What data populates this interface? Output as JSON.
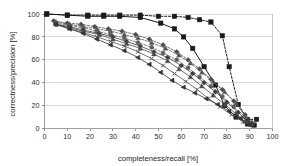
{
  "chart_data": {
    "type": "line",
    "title": "",
    "xlabel": "completeness/recall [%]",
    "ylabel": "correctness/precision [%]",
    "xlim": [
      0,
      100
    ],
    "ylim": [
      0,
      100
    ],
    "xticks": [
      0,
      10,
      20,
      30,
      40,
      50,
      60,
      70,
      80,
      90,
      100
    ],
    "yticks": [
      0,
      20,
      40,
      60,
      80,
      100
    ],
    "xtick_labels": [
      "0",
      "10",
      "20",
      "30",
      "40",
      "50",
      "60",
      "70",
      "80",
      "90",
      "100"
    ],
    "ytick_labels": [
      "0",
      "20",
      "40",
      "60",
      "80",
      "100"
    ],
    "grid": "horizontal",
    "legend": "none",
    "background": "#ffffff",
    "series": [
      {
        "name": "series-1-dashed-square",
        "style": "dashed",
        "marker": "square",
        "color": "#1a1a1a",
        "x": [
          1,
          10,
          19,
          26,
          33,
          42,
          50,
          57,
          63,
          68,
          73,
          78,
          81,
          85,
          89,
          93
        ],
        "y": [
          100,
          99,
          99,
          99,
          99,
          99,
          98,
          98,
          97,
          95,
          93,
          81,
          54,
          21,
          8,
          8
        ]
      },
      {
        "name": "series-2-solid-square",
        "style": "solid",
        "marker": "square",
        "color": "#1a1a1a",
        "x": [
          1,
          10,
          19,
          26,
          33,
          42,
          51,
          57,
          61,
          65,
          70,
          75,
          79,
          84,
          89,
          92
        ],
        "y": [
          100,
          99,
          98,
          98,
          98,
          97,
          92,
          87,
          80,
          70,
          54,
          38,
          20,
          10,
          4,
          3
        ]
      },
      {
        "name": "series-3-dashed-diamond",
        "style": "dashed",
        "marker": "diamond",
        "color": "#4a4a4a",
        "x": [
          4,
          10,
          16,
          22,
          28,
          34,
          40,
          46,
          52,
          58,
          63,
          68,
          73,
          78,
          83,
          88,
          91
        ],
        "y": [
          94,
          92,
          91,
          89,
          87,
          85,
          82,
          78,
          73,
          67,
          60,
          52,
          43,
          34,
          24,
          12,
          5
        ]
      },
      {
        "name": "series-4-dashed-triangle",
        "style": "dashed",
        "marker": "triangle",
        "color": "#555555",
        "x": [
          5,
          11,
          17,
          23,
          29,
          35,
          41,
          47,
          53,
          59,
          64,
          69,
          74,
          79,
          84,
          88,
          91
        ],
        "y": [
          93,
          91,
          89,
          87,
          85,
          82,
          79,
          75,
          70,
          64,
          57,
          49,
          41,
          32,
          22,
          11,
          5
        ]
      },
      {
        "name": "series-5-dashed-circle",
        "style": "dashed",
        "marker": "circle",
        "color": "#5e5e5e",
        "x": [
          5,
          11,
          17,
          23,
          29,
          35,
          41,
          47,
          52,
          58,
          63,
          68,
          73,
          78,
          83,
          88,
          91
        ],
        "y": [
          92,
          90,
          88,
          85,
          82,
          79,
          75,
          71,
          66,
          60,
          53,
          45,
          37,
          28,
          19,
          10,
          4
        ]
      },
      {
        "name": "series-6-solid-diamond",
        "style": "solid",
        "marker": "diamond",
        "color": "#3d3d3d",
        "x": [
          5,
          11,
          17,
          24,
          30,
          36,
          42,
          48,
          54,
          60,
          65,
          70,
          75,
          80,
          85,
          89,
          91
        ],
        "y": [
          91,
          89,
          86,
          83,
          80,
          76,
          72,
          67,
          62,
          55,
          48,
          40,
          32,
          23,
          14,
          6,
          4
        ]
      },
      {
        "name": "series-7-solid-triangle",
        "style": "solid",
        "marker": "triangle",
        "color": "#4a4a4a",
        "x": [
          5,
          11,
          17,
          24,
          30,
          36,
          42,
          48,
          54,
          59,
          64,
          69,
          74,
          79,
          84,
          88,
          91
        ],
        "y": [
          91,
          88,
          85,
          82,
          78,
          74,
          70,
          65,
          59,
          52,
          45,
          37,
          29,
          21,
          13,
          6,
          4
        ]
      },
      {
        "name": "series-8-solid-cross",
        "style": "solid",
        "marker": "cross",
        "color": "#525252",
        "x": [
          5,
          11,
          17,
          23,
          29,
          35,
          41,
          47,
          52,
          57,
          62,
          67,
          72,
          77,
          82,
          87,
          90
        ],
        "y": [
          91,
          87,
          84,
          80,
          76,
          72,
          67,
          61,
          55,
          48,
          41,
          34,
          26,
          19,
          12,
          6,
          3
        ]
      },
      {
        "name": "series-9-solid-lowest",
        "style": "solid",
        "marker": "triangle-left",
        "color": "#333333",
        "x": [
          5,
          11,
          17,
          23,
          29,
          35,
          41,
          46,
          51,
          56,
          61,
          66,
          71,
          76,
          81,
          86,
          90
        ],
        "y": [
          91,
          87,
          83,
          78,
          73,
          68,
          62,
          56,
          49,
          42,
          36,
          31,
          26,
          21,
          15,
          9,
          3
        ]
      }
    ]
  }
}
